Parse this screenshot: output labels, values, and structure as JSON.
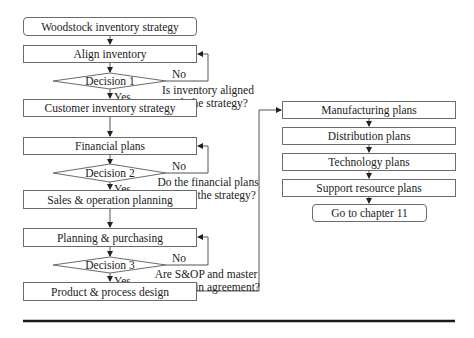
{
  "diagram": {
    "type": "flowchart",
    "left_column": {
      "start": "Woodstock inventory strategy",
      "steps": [
        "Align inventory",
        "Customer inventory strategy",
        "Financial plans",
        "Sales & operation planning",
        "Planning & purchasing",
        "Product & process design"
      ],
      "decisions": [
        {
          "label": "Decision 1",
          "yes": "Yes",
          "no": "No",
          "question_line1": "Is inventory aligned",
          "question_line2": "with the strategy?"
        },
        {
          "label": "Decision 2",
          "yes": "Yes",
          "no": "No",
          "question_line1": "Do the financial plans",
          "question_line2": "support the strategy?"
        },
        {
          "label": "Decision 3",
          "yes": "Yes",
          "no": "No",
          "question_line1": "Are S&OP and master",
          "question_line2": "schedule in agreement?"
        }
      ]
    },
    "right_column": {
      "steps": [
        "Manufacturing plans",
        "Distribution plans",
        "Technology plans",
        "Support resource plans"
      ],
      "end": "Go to chapter 11"
    },
    "colors": {
      "stroke": "#6b6b6b",
      "arrow": "#222222",
      "rule": "#1a1a1a"
    }
  }
}
